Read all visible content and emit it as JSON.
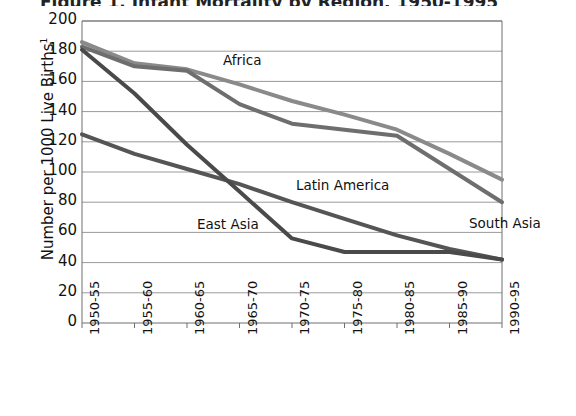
{
  "title": "Figure 1.  Infant Mortality by Region, 1950-1995",
  "axes": {
    "ylabel": "Number per 1000 Live Births",
    "ylabel_footnote": "1",
    "yticks": [
      0,
      20,
      40,
      60,
      80,
      100,
      120,
      140,
      160,
      180,
      200
    ],
    "xticks": [
      "1950-55",
      "1955-60",
      "1960-65",
      "1965-70",
      "1970-75",
      "1975-80",
      "1980-85",
      "1985-90",
      "1990-95"
    ]
  },
  "series_labels": {
    "africa": "Africa",
    "latin_america": "Latin America",
    "east_asia": "East Asia",
    "south_asia": "South Asia"
  },
  "colors": {
    "africa": "#8a8a8a",
    "south_asia": "#6e6e6e",
    "latin_america": "#555555",
    "east_asia": "#4a4a4a",
    "gridline": "#9a9a9a",
    "axis": "#6f6f6f"
  },
  "chart_data": {
    "type": "line",
    "title": "Figure 1.  Infant Mortality by Region, 1950-1995",
    "xlabel": "",
    "ylabel": "Number per 1000 Live Births",
    "ylim": [
      0,
      200
    ],
    "ytick_step": 20,
    "grid": true,
    "legend": "inline-labels",
    "categories": [
      "1950-55",
      "1955-60",
      "1960-65",
      "1965-70",
      "1970-75",
      "1975-80",
      "1980-85",
      "1985-90",
      "1990-95"
    ],
    "series": [
      {
        "name": "Africa",
        "color": "#8a8a8a",
        "values": [
          186,
          172,
          168,
          158,
          147,
          138,
          128,
          112,
          95
        ]
      },
      {
        "name": "South Asia",
        "color": "#6e6e6e",
        "values": [
          183,
          170,
          167,
          145,
          132,
          128,
          124,
          102,
          80
        ]
      },
      {
        "name": "Latin America",
        "color": "#555555",
        "values": [
          125,
          112,
          102,
          92,
          80,
          69,
          58,
          49,
          42
        ]
      },
      {
        "name": "East Asia",
        "color": "#4a4a4a",
        "values": [
          181,
          152,
          118,
          87,
          56,
          47,
          47,
          47,
          42
        ]
      }
    ]
  }
}
